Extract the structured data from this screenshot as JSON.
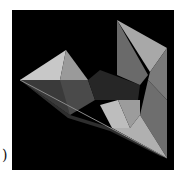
{
  "figure": {
    "panel_label": ")",
    "background_color": "#000000",
    "frame": {
      "x": 12,
      "y": 10,
      "width": 162,
      "height": 160
    },
    "facets": [
      {
        "name": "left-pyramid-top-left",
        "points": "20,80 66,50 60,80",
        "fill": "#c8c8c8"
      },
      {
        "name": "left-pyramid-top-right",
        "points": "66,50 88,80 60,80",
        "fill": "#9a9a9a"
      },
      {
        "name": "left-pyramid-lower",
        "points": "20,80 88,80 95,100 70,115",
        "fill": "#4a4a4a"
      },
      {
        "name": "left-pyramid-lower-shade",
        "points": "20,80 60,80 70,115",
        "fill": "#3a3a3a"
      },
      {
        "name": "center-dark-band",
        "points": "88,80 100,70 140,85 138,100 118,100 95,100",
        "fill": "#262626"
      },
      {
        "name": "right-tall-left-face",
        "points": "117,20 117,75 140,85 148,75",
        "fill": "#6a6a6a"
      },
      {
        "name": "right-tall-front-face",
        "points": "117,20 167,48 150,72",
        "fill": "#a8a8a8"
      },
      {
        "name": "right-tall-side",
        "points": "167,48 167,100 148,80 150,72",
        "fill": "#7a7a7a"
      },
      {
        "name": "right-lower-side",
        "points": "148,80 167,100 167,158 140,115",
        "fill": "#6e6e6e"
      },
      {
        "name": "bottom-light-left",
        "points": "100,105 118,100 130,128 112,128",
        "fill": "#bdbdbd"
      },
      {
        "name": "bottom-light-mid",
        "points": "118,100 140,100 140,115 130,128",
        "fill": "#9c9c9c"
      },
      {
        "name": "bottom-light-right",
        "points": "112,128 130,128 140,115 167,158",
        "fill": "#b0b0b0"
      },
      {
        "name": "bottom-edge-strip",
        "points": "20,80 70,115 112,128 167,158 160,156 110,131 68,118",
        "fill": "#2e2e2e"
      }
    ],
    "edges": [
      {
        "x1": 20,
        "y1": 80,
        "x2": 167,
        "y2": 158,
        "stroke": "#8a8a8a"
      }
    ]
  }
}
